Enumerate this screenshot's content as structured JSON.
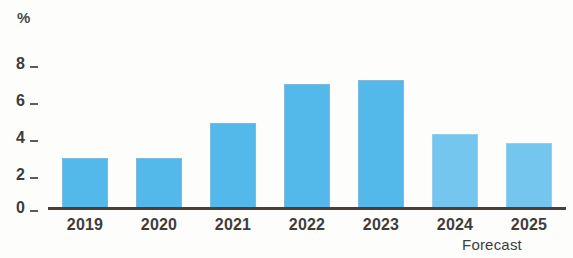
{
  "chart_data": {
    "type": "bar",
    "title": "",
    "subtitle": "",
    "xlabel": "",
    "ylabel": "%",
    "unit_label": "%",
    "categories": [
      "2019",
      "2020",
      "2021",
      "2022",
      "2023",
      "2024",
      "2025"
    ],
    "values": [
      2.3,
      2.3,
      3.9,
      5.7,
      5.9,
      3.4,
      3.0
    ],
    "series": [
      {
        "name": "",
        "values": [
          2.3,
          2.3,
          3.9,
          5.7,
          5.9,
          3.4,
          3.0
        ]
      }
    ],
    "ylim": [
      0,
      9
    ],
    "ytick_labels": [
      "0",
      "2",
      "4",
      "6",
      "8"
    ],
    "ytick_values": [
      0,
      2,
      4,
      6,
      8
    ],
    "grid": false,
    "legend": false,
    "legend_position": "none",
    "annotations": [
      {
        "text": "Forecast",
        "covers": [
          "2024",
          "2025"
        ]
      }
    ],
    "forecast_categories": [
      "2024",
      "2025"
    ],
    "colors": {
      "bar": "#53b9ea",
      "bar_forecast": "#74c6ef",
      "axis": "#4a3f38",
      "text": "#3d3d3d",
      "background": "#fdfdfc"
    }
  },
  "axis": {
    "unit": "%",
    "ticks": [
      {
        "label": "8",
        "value": 8
      },
      {
        "label": "6",
        "value": 6
      },
      {
        "label": "4",
        "value": 4
      },
      {
        "label": "2",
        "value": 2
      },
      {
        "label": "0",
        "value": 0
      }
    ]
  },
  "footnote": {
    "forecast": "Forecast"
  }
}
